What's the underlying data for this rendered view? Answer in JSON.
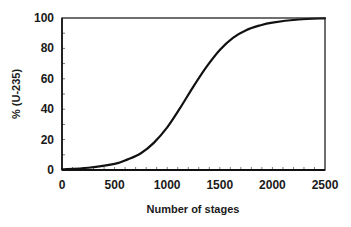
{
  "chart_data": {
    "type": "line",
    "title": "",
    "xlabel": "Number of stages",
    "ylabel": "% (U-235)",
    "xlim": [
      0,
      2500
    ],
    "ylim": [
      0,
      100
    ],
    "x_ticks": [
      0,
      500,
      1000,
      1500,
      2000,
      2500
    ],
    "x_tick_labels": [
      "0",
      "500",
      "1000",
      "1500",
      "2000",
      "2500"
    ],
    "x_minor_step": 100,
    "y_ticks": [
      0,
      20,
      40,
      60,
      80,
      100
    ],
    "y_tick_labels": [
      "0",
      "20",
      "40",
      "60",
      "80",
      "100"
    ],
    "y_minor_step": 10,
    "grid": false,
    "legend": null,
    "series": [
      {
        "name": "U-235 enrichment",
        "color": "#111111",
        "x": [
          0,
          250,
          500,
          625,
          750,
          875,
          1000,
          1125,
          1250,
          1375,
          1500,
          1625,
          1750,
          1875,
          2000,
          2250,
          2500
        ],
        "values": [
          0.5,
          1.5,
          4,
          7,
          11,
          18,
          28,
          41,
          55,
          68,
          79,
          87,
          92,
          95,
          97,
          99,
          99.8
        ]
      }
    ]
  }
}
